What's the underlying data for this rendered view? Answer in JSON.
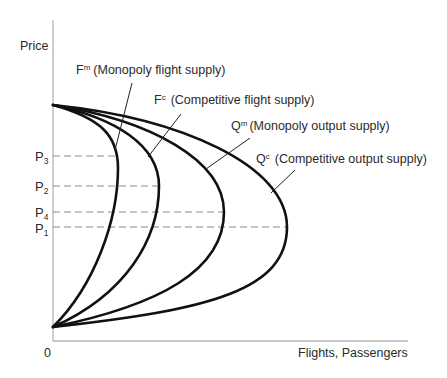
{
  "axes": {
    "y_label": "Price",
    "x_label": "Flights, Passengers",
    "origin_label": "0"
  },
  "price_levels": [
    {
      "id": "P3",
      "base": "P",
      "sub": "3",
      "order_from_top": 1,
      "touches_curve": "Fm"
    },
    {
      "id": "P2",
      "base": "P",
      "sub": "2",
      "order_from_top": 2,
      "touches_curve": "Fc"
    },
    {
      "id": "P4",
      "base": "P",
      "sub": "4",
      "order_from_top": 3,
      "touches_curve": "Qm"
    },
    {
      "id": "P1",
      "base": "P",
      "sub": "1",
      "order_from_top": 4,
      "touches_curve": "Qc"
    }
  ],
  "curves": [
    {
      "id": "Fm",
      "base": "F",
      "sup": "m",
      "description": "(Monopoly flight supply)"
    },
    {
      "id": "Fc",
      "base": "F",
      "sup": "c",
      "description": "(Competitive flight supply)"
    },
    {
      "id": "Qm",
      "base": "Q",
      "sup": "m",
      "description": "(Monopoly output supply)"
    },
    {
      "id": "Qc",
      "base": "Q",
      "sup": "c",
      "description": "(Competitive output supply)"
    }
  ],
  "colors": {
    "curve": "#111111",
    "axis": "#b5b5b5",
    "dashed_guide": "#8a8a8a",
    "text": "#2a2a2a"
  }
}
